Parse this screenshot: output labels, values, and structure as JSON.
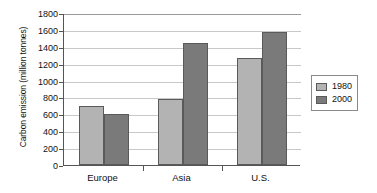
{
  "chart_data": {
    "type": "bar",
    "title": "",
    "subtitle": "",
    "xlabel": "",
    "ylabel": "Carbon emission (million tonnes)",
    "categories": [
      "Europe",
      "Asia",
      "U.S."
    ],
    "series": [
      {
        "name": "1980",
        "values": [
          700,
          780,
          1270
        ],
        "color": "#b3b3b3"
      },
      {
        "name": "2000",
        "values": [
          610,
          1450,
          1580
        ],
        "color": "#7a7a7a"
      }
    ],
    "ylim": [
      0,
      1800
    ],
    "ytick_step": 200,
    "yticks": [
      1800,
      1600,
      1400,
      1200,
      1000,
      800,
      600,
      400,
      200,
      0
    ],
    "ytick_labels": [
      "1800",
      "1600",
      "1400",
      "1200",
      "1000",
      "800",
      "600",
      "400",
      "200",
      "0"
    ],
    "grid": true,
    "grid_axis": "y",
    "legend_position": "right",
    "legend_entries": [
      "1980",
      "2000"
    ]
  }
}
